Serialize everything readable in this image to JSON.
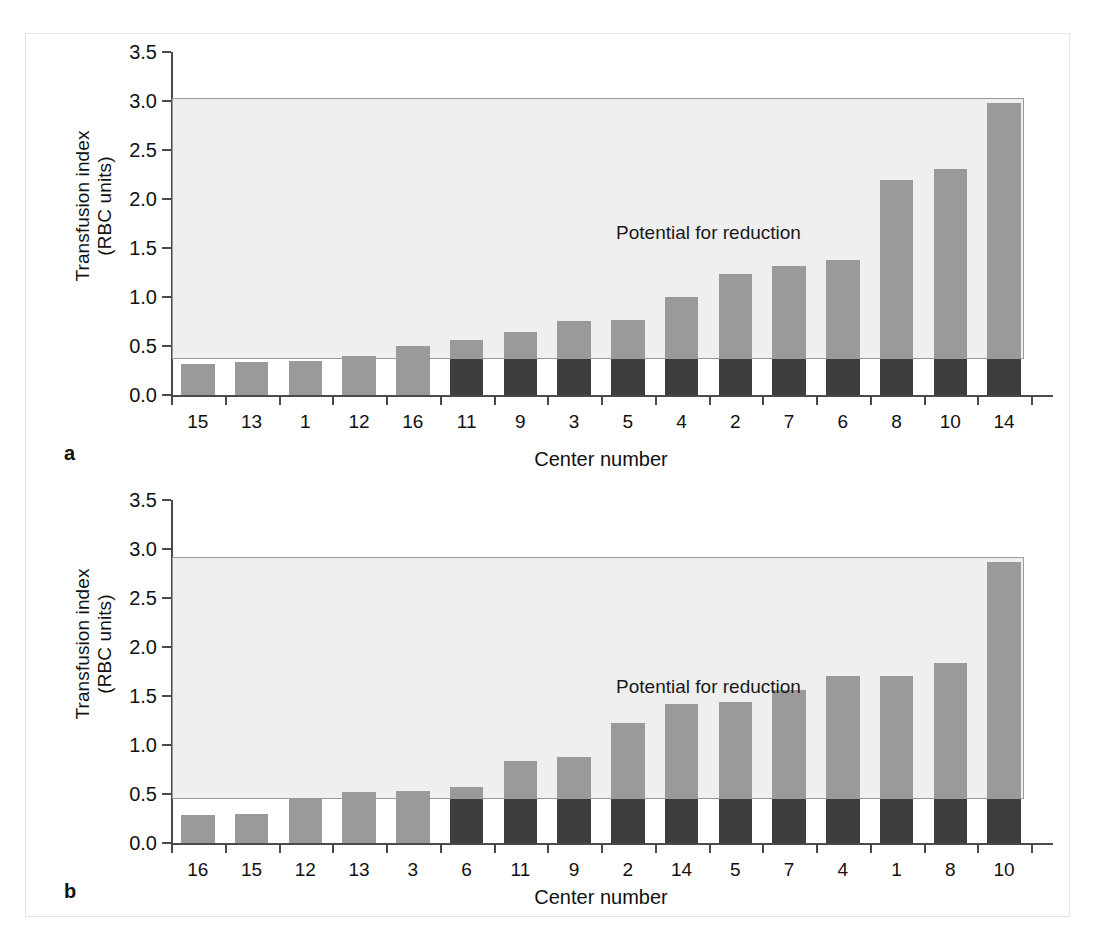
{
  "figure": {
    "ylabel_line1": "Transfusion index",
    "ylabel_line2": "(RBC units)",
    "xlabel": "Center number",
    "annotation": "Potential for reduction",
    "panel_a_letter": "a",
    "panel_b_letter": "b",
    "colors": {
      "bar_upper": "#9a9a9a",
      "bar_lower": "#3d3d3d",
      "potential_box_fill": "#efefef",
      "potential_box_border": "#9a9a9a",
      "axis": "#4a4a4a",
      "page_border": "#e3e3e3"
    }
  },
  "chart_data": [
    {
      "type": "bar",
      "panel": "a",
      "title": "",
      "xlabel": "Center number",
      "ylabel": "Transfusion index (RBC units)",
      "ylim": [
        0.0,
        3.5
      ],
      "yticks": [
        "0.0",
        "0.5",
        "1.0",
        "1.5",
        "2.0",
        "2.5",
        "3.0",
        "3.5"
      ],
      "ytick_values": [
        0.0,
        0.5,
        1.0,
        1.5,
        2.0,
        2.5,
        3.0,
        3.5
      ],
      "grid": false,
      "legend": "none",
      "annotation": "Potential for reduction",
      "benchmark_threshold": 0.37,
      "box_top": 3.03,
      "categories": [
        "15",
        "13",
        "1",
        "12",
        "16",
        "11",
        "9",
        "3",
        "5",
        "4",
        "2",
        "7",
        "6",
        "8",
        "10",
        "14"
      ],
      "values": [
        0.32,
        0.34,
        0.35,
        0.4,
        0.5,
        0.56,
        0.64,
        0.76,
        0.77,
        1.0,
        1.23,
        1.32,
        1.38,
        2.19,
        2.31,
        2.98
      ],
      "series": [
        {
          "name": "Below benchmark (dark)",
          "values": [
            0.0,
            0.0,
            0.0,
            0.0,
            0.0,
            0.37,
            0.37,
            0.37,
            0.37,
            0.37,
            0.37,
            0.37,
            0.37,
            0.37,
            0.37,
            0.37
          ]
        },
        {
          "name": "Potential for reduction (gray)",
          "values": [
            0.32,
            0.34,
            0.35,
            0.4,
            0.5,
            0.19,
            0.27,
            0.39,
            0.4,
            0.63,
            0.86,
            0.95,
            1.01,
            1.82,
            1.94,
            2.61
          ]
        }
      ]
    },
    {
      "type": "bar",
      "panel": "b",
      "title": "",
      "xlabel": "Center number",
      "ylabel": "Transfusion index (RBC units)",
      "ylim": [
        0.0,
        3.5
      ],
      "yticks": [
        "0.0",
        "0.5",
        "1.0",
        "1.5",
        "2.0",
        "2.5",
        "3.0",
        "3.5"
      ],
      "ytick_values": [
        0.0,
        0.5,
        1.0,
        1.5,
        2.0,
        2.5,
        3.0,
        3.5
      ],
      "grid": false,
      "legend": "none",
      "annotation": "Potential for reduction",
      "benchmark_threshold": 0.45,
      "box_top": 2.92,
      "categories": [
        "16",
        "15",
        "12",
        "13",
        "3",
        "6",
        "11",
        "9",
        "2",
        "14",
        "5",
        "7",
        "4",
        "1",
        "8",
        "10"
      ],
      "values": [
        0.29,
        0.3,
        0.45,
        0.52,
        0.53,
        0.57,
        0.84,
        0.88,
        1.22,
        1.42,
        1.44,
        1.56,
        1.7,
        1.7,
        1.84,
        2.87
      ],
      "series": [
        {
          "name": "Below benchmark (dark)",
          "values": [
            0.0,
            0.0,
            0.0,
            0.0,
            0.0,
            0.45,
            0.45,
            0.45,
            0.45,
            0.45,
            0.45,
            0.45,
            0.45,
            0.45,
            0.45,
            0.45
          ]
        },
        {
          "name": "Potential for reduction (gray)",
          "values": [
            0.29,
            0.3,
            0.45,
            0.52,
            0.53,
            0.12,
            0.39,
            0.43,
            0.77,
            0.97,
            0.99,
            1.11,
            1.25,
            1.25,
            1.39,
            2.42
          ]
        }
      ]
    }
  ]
}
